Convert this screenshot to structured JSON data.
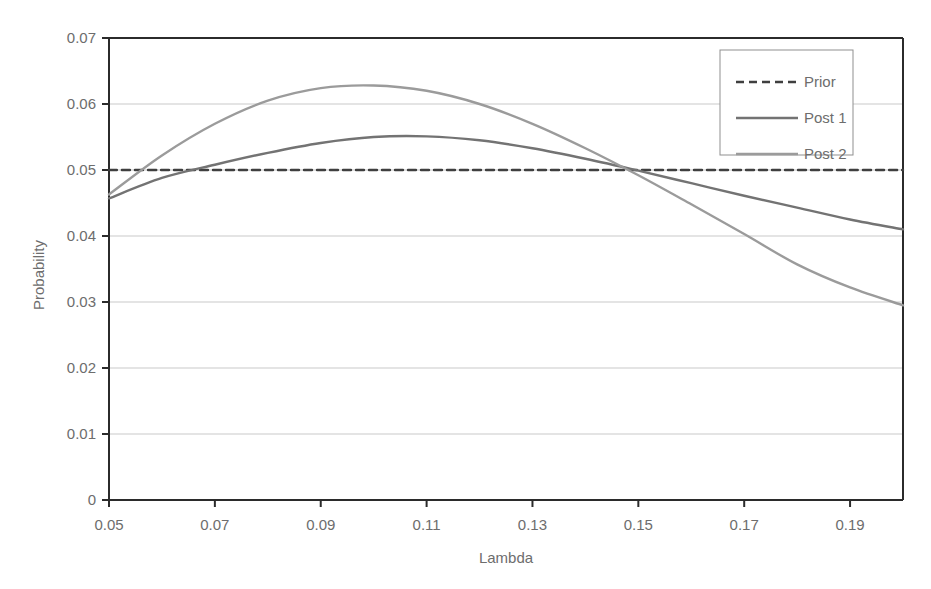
{
  "chart_data": {
    "type": "line",
    "title": "",
    "xlabel": "Lambda",
    "ylabel": "Probability",
    "xlim": [
      0.05,
      0.2
    ],
    "ylim": [
      0,
      0.07
    ],
    "xticks": [
      "0.05",
      "0.07",
      "0.09",
      "0.11",
      "0.13",
      "0.15",
      "0.17",
      "0.19"
    ],
    "xtick_values": [
      0.05,
      0.07,
      0.09,
      0.11,
      0.13,
      0.15,
      0.17,
      0.19
    ],
    "yticks": [
      "0",
      "0.01",
      "0.02",
      "0.03",
      "0.04",
      "0.05",
      "0.06",
      "0.07"
    ],
    "ytick_values": [
      0,
      0.01,
      0.02,
      0.03,
      0.04,
      0.05,
      0.06,
      0.07
    ],
    "grid": "horizontal",
    "legend_position": "top-right",
    "x": [
      0.05,
      0.06,
      0.07,
      0.08,
      0.09,
      0.1,
      0.11,
      0.12,
      0.13,
      0.14,
      0.15,
      0.16,
      0.17,
      0.18,
      0.19,
      0.2
    ],
    "series": [
      {
        "name": "Prior",
        "style": "dashed",
        "color": "#3f3f3f",
        "width": 2.4,
        "values": [
          0.05,
          0.05,
          0.05,
          0.05,
          0.05,
          0.05,
          0.05,
          0.05,
          0.05,
          0.05,
          0.05,
          0.05,
          0.05,
          0.05,
          0.05,
          0.05
        ]
      },
      {
        "name": "Post 1",
        "style": "solid",
        "color": "#737373",
        "width": 2.4,
        "values": [
          0.0457,
          0.0488,
          0.0508,
          0.0526,
          0.0541,
          0.055,
          0.0551,
          0.0545,
          0.0533,
          0.0517,
          0.0499,
          0.048,
          0.0461,
          0.0443,
          0.0425,
          0.041
        ]
      },
      {
        "name": "Post 2",
        "style": "solid",
        "color": "#9b9b9b",
        "width": 2.4,
        "values": [
          0.0463,
          0.0522,
          0.057,
          0.0605,
          0.0624,
          0.0628,
          0.062,
          0.06,
          0.057,
          0.0533,
          0.0492,
          0.0448,
          0.0403,
          0.0357,
          0.0322,
          0.0295
        ]
      }
    ]
  },
  "legend": {
    "items": [
      {
        "label": "Prior"
      },
      {
        "label": "Post 1"
      },
      {
        "label": "Post 2"
      }
    ]
  },
  "colors": {
    "prior": "#3f3f3f",
    "post1": "#737373",
    "post2": "#9b9b9b",
    "grid": "#c9c9c9",
    "axis": "#2b2b2b",
    "text": "#6d6d6d",
    "legend_border": "#8f8f8f",
    "background": "#ffffff"
  }
}
